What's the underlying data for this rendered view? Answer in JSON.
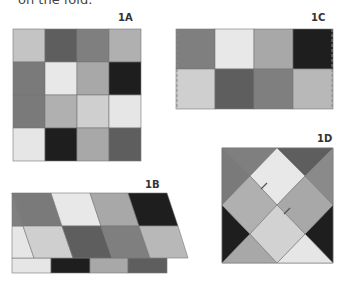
{
  "header": {
    "text": "on the fold."
  },
  "panels": {
    "1A": {
      "label": "1A"
    },
    "1B": {
      "label": "1B"
    },
    "1C": {
      "label": "1C"
    },
    "1D": {
      "label": "1D"
    }
  },
  "colors": {
    "light": "#e6e6e6",
    "lightgray": "#c4c4c4",
    "midgray": "#a6a6a6",
    "gray": "#8a8a8a",
    "dark": "#5e5e5e",
    "black": "#1e1e1e",
    "dash": "#888888"
  }
}
